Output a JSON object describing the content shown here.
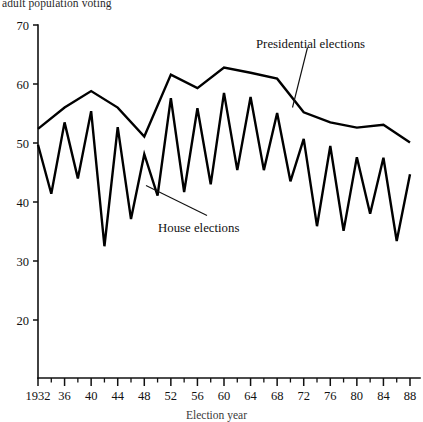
{
  "figure": {
    "top_caption": "adult population voting",
    "bottom_caption": "Election year"
  },
  "annotations": {
    "presidential": "Presidential elections",
    "house": "House elections"
  },
  "chart_data": {
    "type": "line",
    "title": "",
    "subtitle": "",
    "xlabel": "Election year",
    "ylabel": "adult population voting",
    "xlim": [
      1932,
      1988
    ],
    "ylim": [
      14,
      70
    ],
    "grid": false,
    "legend": "inline-annotations",
    "y_ticks": [
      20,
      30,
      40,
      50,
      60,
      70
    ],
    "y_tick_labels": [
      "20",
      "30",
      "40",
      "50",
      "60",
      "70"
    ],
    "x_ticks": [
      1932,
      1936,
      1940,
      1944,
      1948,
      1952,
      1956,
      1960,
      1964,
      1968,
      1972,
      1976,
      1980,
      1984,
      1988
    ],
    "x_tick_labels": [
      "1932",
      "36",
      "40",
      "44",
      "48",
      "52",
      "56",
      "60",
      "64",
      "68",
      "72",
      "76",
      "80",
      "84",
      "88"
    ],
    "x_minor_ticks": [
      1934,
      1938,
      1942,
      1946,
      1950,
      1954,
      1958,
      1962,
      1966,
      1970,
      1974,
      1978,
      1982,
      1986
    ],
    "series": [
      {
        "name": "Presidential elections",
        "x": [
          1932,
          1936,
          1940,
          1944,
          1948,
          1952,
          1956,
          1960,
          1964,
          1968,
          1972,
          1976,
          1980,
          1984,
          1988
        ],
        "values": [
          52.4,
          56.0,
          58.8,
          56.0,
          51.1,
          61.6,
          59.3,
          62.8,
          61.9,
          60.9,
          55.2,
          53.5,
          52.6,
          53.1,
          50.1
        ]
      },
      {
        "name": "House elections",
        "x": [
          1932,
          1934,
          1936,
          1938,
          1940,
          1942,
          1944,
          1946,
          1948,
          1950,
          1952,
          1954,
          1956,
          1958,
          1960,
          1962,
          1964,
          1966,
          1968,
          1970,
          1972,
          1974,
          1976,
          1978,
          1980,
          1982,
          1984,
          1986,
          1988
        ],
        "values": [
          49.7,
          41.4,
          53.5,
          44.0,
          55.4,
          32.5,
          52.7,
          37.1,
          48.1,
          41.1,
          57.6,
          41.7,
          55.9,
          43.0,
          58.5,
          45.4,
          57.8,
          45.4,
          55.1,
          43.5,
          50.7,
          35.9,
          49.5,
          35.1,
          47.6,
          38.0,
          47.5,
          33.4,
          44.7
        ]
      }
    ]
  }
}
